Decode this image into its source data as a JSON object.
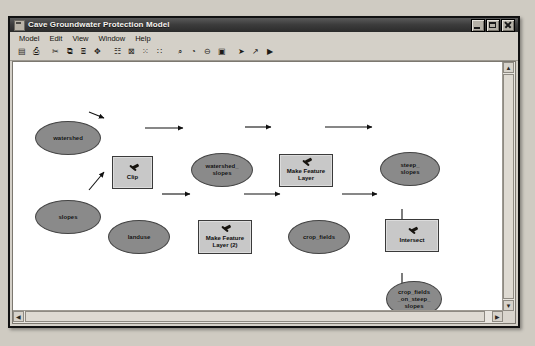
{
  "window": {
    "title": "Cave Groundwater Protection Model",
    "icon": "model-window-icon",
    "buttons": {
      "minimize": "Minimize",
      "maximize": "Maximize",
      "close": "Close"
    }
  },
  "menubar": {
    "items": [
      {
        "label": "Model",
        "name": "menu-model"
      },
      {
        "label": "Edit",
        "name": "menu-edit"
      },
      {
        "label": "View",
        "name": "menu-view"
      },
      {
        "label": "Window",
        "name": "menu-window"
      },
      {
        "label": "Help",
        "name": "menu-help"
      }
    ]
  },
  "toolbar": {
    "buttons": [
      {
        "name": "save-icon",
        "glyph": "▤",
        "tip": "Save"
      },
      {
        "name": "print-icon",
        "glyph": "⎙",
        "tip": "Print"
      },
      {
        "name": "cut-icon",
        "glyph": "✂",
        "tip": "Cut"
      },
      {
        "name": "copy-icon",
        "glyph": "⧉",
        "tip": "Copy"
      },
      {
        "name": "paste-icon",
        "glyph": "⌸",
        "tip": "Paste"
      },
      {
        "name": "add-data-icon",
        "glyph": "✥",
        "tip": "Add Data"
      },
      {
        "name": "auto-layout-icon",
        "glyph": "☷",
        "tip": "Auto Layout"
      },
      {
        "name": "full-extent-icon",
        "glyph": "⊠",
        "tip": "Full Extent"
      },
      {
        "name": "diagram-properties-icon",
        "glyph": "⁙",
        "tip": "Diagram Properties"
      },
      {
        "name": "grid-icon",
        "glyph": "∷",
        "tip": "Grid"
      },
      {
        "name": "zoom-in-icon",
        "glyph": "⌕",
        "tip": "Zoom In"
      },
      {
        "name": "pan-icon",
        "glyph": "◔",
        "tip": "Pan"
      },
      {
        "name": "zoom-out-icon",
        "glyph": "⊖",
        "tip": "Zoom Out"
      },
      {
        "name": "zoom-window-icon",
        "glyph": "▣",
        "tip": "Zoom to Window"
      },
      {
        "name": "select-pointer-icon",
        "glyph": "➤",
        "tip": "Select"
      },
      {
        "name": "connect-icon",
        "glyph": "↗",
        "tip": "Connect"
      },
      {
        "name": "run-icon",
        "glyph": "▶",
        "tip": "Run"
      }
    ]
  },
  "diagram": {
    "title": "Cave Groundwater Protection Model",
    "nodes": [
      {
        "id": "watershed",
        "type": "data",
        "label": "watershed",
        "x": 22,
        "y": 59,
        "w": 66,
        "h": 34
      },
      {
        "id": "slopes",
        "type": "data",
        "label": "slopes",
        "x": 22,
        "y": 138,
        "w": 66,
        "h": 34
      },
      {
        "id": "clip",
        "type": "tool",
        "label": "Clip",
        "x": 99,
        "y": 94,
        "w": 41,
        "h": 33
      },
      {
        "id": "watershed_slopes",
        "type": "data",
        "label": "watershed_\nslopes",
        "x": 178,
        "y": 91,
        "w": 62,
        "h": 34
      },
      {
        "id": "make_feature_layer",
        "type": "tool",
        "label": "Make Feature\nLayer",
        "x": 266,
        "y": 92,
        "w": 54,
        "h": 33
      },
      {
        "id": "steep_slopes",
        "type": "data",
        "label": "steep_\nslopes",
        "x": 367,
        "y": 90,
        "w": 60,
        "h": 34
      },
      {
        "id": "landuse",
        "type": "data",
        "label": "landuse",
        "x": 95,
        "y": 158,
        "w": 62,
        "h": 34
      },
      {
        "id": "make_feature_layer_2",
        "type": "tool",
        "label": "Make Feature\nLayer (2)",
        "x": 185,
        "y": 158,
        "w": 54,
        "h": 34
      },
      {
        "id": "crop_fields",
        "type": "data",
        "label": "crop_fields",
        "x": 275,
        "y": 158,
        "w": 62,
        "h": 34
      },
      {
        "id": "intersect",
        "type": "tool",
        "label": "Intersect",
        "x": 372,
        "y": 157,
        "w": 54,
        "h": 33
      },
      {
        "id": "crop_fields_on_steep_slopes",
        "type": "data",
        "label": "crop_fields\n_on_steep_\nslopes",
        "x": 373,
        "y": 219,
        "w": 56,
        "h": 36
      },
      {
        "id": "streams",
        "type": "data",
        "label": "streams",
        "x": 95,
        "y": 281,
        "w": 62,
        "h": 34
      },
      {
        "id": "buffer",
        "type": "tool",
        "label": "Buffer",
        "x": 186,
        "y": 282,
        "w": 54,
        "h": 32
      },
      {
        "id": "streams_300mbuffer",
        "type": "data",
        "label": "streams_\n300mbuffer",
        "x": 275,
        "y": 281,
        "w": 62,
        "h": 34
      },
      {
        "id": "intersect_2",
        "type": "tool",
        "label": "Intersect (2)",
        "x": 371,
        "y": 282,
        "w": 54,
        "h": 31
      },
      {
        "id": "model_results",
        "type": "data",
        "label": "model_\nresults",
        "x": 450,
        "y": 281,
        "w": 56,
        "h": 34
      }
    ],
    "edges": [
      {
        "from": "watershed",
        "to": "clip"
      },
      {
        "from": "slopes",
        "to": "clip"
      },
      {
        "from": "clip",
        "to": "watershed_slopes"
      },
      {
        "from": "watershed_slopes",
        "to": "make_feature_layer"
      },
      {
        "from": "make_feature_layer",
        "to": "steep_slopes"
      },
      {
        "from": "steep_slopes",
        "to": "intersect"
      },
      {
        "from": "landuse",
        "to": "make_feature_layer_2"
      },
      {
        "from": "make_feature_layer_2",
        "to": "crop_fields"
      },
      {
        "from": "crop_fields",
        "to": "intersect"
      },
      {
        "from": "intersect",
        "to": "crop_fields_on_steep_slopes"
      },
      {
        "from": "crop_fields_on_steep_slopes",
        "to": "intersect_2"
      },
      {
        "from": "streams",
        "to": "buffer"
      },
      {
        "from": "buffer",
        "to": "streams_300mbuffer"
      },
      {
        "from": "streams_300mbuffer",
        "to": "intersect_2"
      },
      {
        "from": "intersect_2",
        "to": "model_results"
      }
    ]
  },
  "colors": {
    "data_node": "#8a8a8a",
    "tool_node": "#c8c8c8",
    "node_outline": "#3a3a3a",
    "canvas": "#ffffff",
    "chrome": "#d4d0c8",
    "titlebar": "#2b2b2b"
  },
  "scrollbars": {
    "vertical": {
      "up": "▲",
      "down": "▼"
    },
    "horizontal": {
      "left": "◀",
      "right": "▶"
    }
  }
}
